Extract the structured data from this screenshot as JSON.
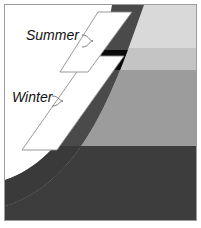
{
  "figure": {
    "name": "seasonal-thermocline-cross-section",
    "width": 201,
    "height": 228,
    "background": "#ffffff",
    "frame_color": "#9c9c9c"
  },
  "labels": {
    "summer": "Summer",
    "winter": "Winter"
  },
  "colors": {
    "band_top_light": "#d9d9d9",
    "band_upper_mid": "#c4c4c4",
    "band_mid": "#9c9c9c",
    "band_bottom_dark": "#3d3d3d",
    "arc_band_dark": "#4a4a4a",
    "highlight_black": "#0b0b0b",
    "callout_fill": "#ffffff",
    "callout_stroke": "#8d8d8d",
    "leader_stroke": "#6f6f6f",
    "text": "#111111"
  },
  "geometry": {
    "frame": {
      "x": 4,
      "y": 4,
      "width": 193,
      "height": 217
    },
    "bands": [
      {
        "name": "band-top-light",
        "y_top": 5,
        "y_bottom": 48,
        "color": "#d9d9d9"
      },
      {
        "name": "band-upper-mid",
        "y_top": 48,
        "y_bottom": 70,
        "color": "#c4c4c4"
      },
      {
        "name": "band-mid",
        "y_top": 70,
        "y_bottom": 146,
        "color": "#9c9c9c"
      },
      {
        "name": "band-bottom-dark",
        "y_top": 146,
        "y_bottom": 220,
        "color": "#3d3d3d"
      }
    ],
    "highlight_rect": {
      "x": 103,
      "y": 50,
      "width": 27,
      "height": 20
    },
    "callout_summer": {
      "points": "98,12 132,12 88,72 60,72"
    },
    "callout_winter": {
      "points": "88,56 124,56 57,150 22,150"
    }
  },
  "leaders": {
    "summer": {
      "from_x": 82,
      "from_y": 35,
      "to_x": 96,
      "to_y": 42
    },
    "winter": {
      "from_x": 52,
      "from_y": 97,
      "to_x": 66,
      "to_y": 100
    }
  }
}
